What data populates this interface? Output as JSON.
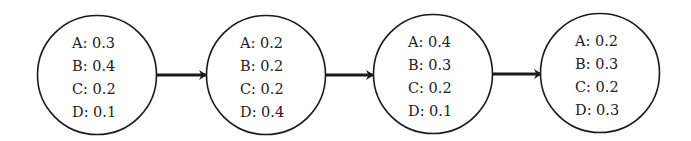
{
  "diagram": {
    "type": "markov-chain-sequence",
    "stroke_color": "#1a1a1a",
    "nodes": [
      {
        "id": "state-1",
        "lines": [
          "A: 0.3",
          "B: 0.4",
          "C: 0.2",
          "D: 0.1"
        ]
      },
      {
        "id": "state-2",
        "lines": [
          "A: 0.2",
          "B: 0.2",
          "C: 0.2",
          "D: 0.4"
        ]
      },
      {
        "id": "state-3",
        "lines": [
          "A: 0.4",
          "B: 0.3",
          "C: 0.2",
          "D: 0.1"
        ]
      },
      {
        "id": "state-4",
        "lines": [
          "A: 0.2",
          "B: 0.3",
          "C: 0.2",
          "D: 0.3"
        ]
      }
    ],
    "edges": [
      {
        "from": "state-1",
        "to": "state-2"
      },
      {
        "from": "state-2",
        "to": "state-3"
      },
      {
        "from": "state-3",
        "to": "state-4"
      }
    ]
  }
}
